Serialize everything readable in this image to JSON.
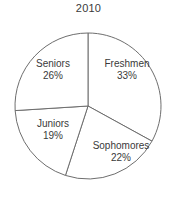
{
  "chart_data": {
    "type": "pie",
    "title": "2010",
    "subtitle": "",
    "xlabel": "",
    "ylabel": "",
    "categories": [
      "Freshmen",
      "Sophomores",
      "Juniors",
      "Seniors"
    ],
    "values": [
      33,
      22,
      19,
      26
    ],
    "value_unit": "%",
    "value_labels": [
      "33%",
      "22%",
      "19%",
      "26%"
    ],
    "start_angle_deg": 0,
    "direction": "clockwise",
    "legend": "none",
    "grid": false,
    "slice_fill": "#ffffff",
    "slice_stroke": "#6e6e6e",
    "text_color": "#3a3a3a",
    "background": "#ffffff",
    "slices": [
      {
        "label": "Freshmen",
        "value": 33,
        "value_label": "33%",
        "start_deg": 0.0,
        "end_deg": 118.8
      },
      {
        "label": "Sophomores",
        "value": 22,
        "value_label": "22%",
        "start_deg": 118.8,
        "end_deg": 198.0
      },
      {
        "label": "Juniors",
        "value": 19,
        "value_label": "19%",
        "start_deg": 198.0,
        "end_deg": 266.4
      },
      {
        "label": "Seniors",
        "value": 26,
        "value_label": "26%",
        "start_deg": 266.4,
        "end_deg": 360.0
      }
    ]
  },
  "title": {
    "text": "2010"
  },
  "labels": {
    "freshmen": {
      "name": "Freshmen",
      "value": "33%"
    },
    "sophomores": {
      "name": "Sophomores",
      "value": "22%"
    },
    "juniors": {
      "name": "Juniors",
      "value": "19%"
    },
    "seniors": {
      "name": "Seniors",
      "value": "26%"
    }
  }
}
